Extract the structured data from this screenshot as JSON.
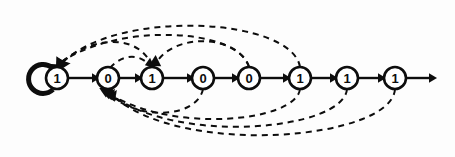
{
  "diagram": {
    "type": "state-transition-diagram",
    "background_color": "#fdfdfd",
    "stroke_color": "#0d0d0d",
    "node_fill": "#ffffff",
    "nodes": [
      {
        "id": "n1",
        "label": "1",
        "cx": 57,
        "cy": 78,
        "r": 11
      },
      {
        "id": "n2",
        "label": "0",
        "cx": 108,
        "cy": 78,
        "r": 11
      },
      {
        "id": "n3",
        "label": "1",
        "cx": 152,
        "cy": 78,
        "r": 11
      },
      {
        "id": "n4",
        "label": "0",
        "cx": 203,
        "cy": 78,
        "r": 11
      },
      {
        "id": "n5",
        "label": "0",
        "cx": 249,
        "cy": 78,
        "r": 11
      },
      {
        "id": "n6",
        "label": "1",
        "cx": 300,
        "cy": 78,
        "r": 11
      },
      {
        "id": "n7",
        "label": "1",
        "cx": 347,
        "cy": 78,
        "r": 11
      },
      {
        "id": "n8",
        "label": "1",
        "cx": 395,
        "cy": 78,
        "r": 11
      }
    ],
    "sequence": [
      "1",
      "0",
      "1",
      "0",
      "0",
      "1",
      "1",
      "1"
    ],
    "self_loop": {
      "on_node": "n1",
      "style": "solid-thick",
      "label": ""
    },
    "forward_edges": [
      {
        "from": "n1",
        "to": "n2",
        "style": "solid"
      },
      {
        "from": "n2",
        "to": "n3",
        "style": "solid"
      },
      {
        "from": "n3",
        "to": "n4",
        "style": "solid"
      },
      {
        "from": "n4",
        "to": "n5",
        "style": "solid"
      },
      {
        "from": "n5",
        "to": "n6",
        "style": "solid"
      },
      {
        "from": "n6",
        "to": "n7",
        "style": "solid"
      },
      {
        "from": "n7",
        "to": "n8",
        "style": "solid"
      },
      {
        "from": "n8",
        "to": "exit",
        "style": "solid"
      }
    ],
    "back_edges_top": [
      {
        "from": "n6",
        "to": "n1",
        "style": "dashed",
        "side": "above"
      },
      {
        "from": "n5",
        "to": "n1",
        "style": "dashed",
        "side": "above"
      },
      {
        "from": "n3",
        "to": "n1",
        "style": "dashed",
        "side": "above"
      },
      {
        "from": "n2",
        "to": "n3",
        "style": "dashed",
        "side": "above"
      },
      {
        "from": "n5",
        "to": "n3",
        "style": "dashed",
        "side": "above"
      }
    ],
    "back_edges_bottom": [
      {
        "from": "n8",
        "to": "n2",
        "style": "dashed",
        "side": "below"
      },
      {
        "from": "n7",
        "to": "n2",
        "style": "dashed",
        "side": "below"
      },
      {
        "from": "n6",
        "to": "n2",
        "style": "dashed",
        "side": "below"
      },
      {
        "from": "n4",
        "to": "n2",
        "style": "dashed",
        "side": "below"
      }
    ],
    "exit_arrow": {
      "from_x": 406,
      "to_x": 437,
      "y": 78
    }
  }
}
